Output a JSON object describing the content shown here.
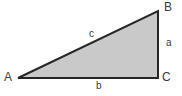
{
  "diagram": {
    "type": "right-triangle-geometry",
    "canvas": {
      "width": 182,
      "height": 96,
      "background": "#ffffff"
    },
    "style": {
      "fill_color": "#c9c9c9",
      "stroke_color": "#262626",
      "stroke_width": 2,
      "label_color": "#3a3a3a"
    },
    "vertices": [
      {
        "name": "A",
        "label": "A",
        "x": 18,
        "y": 78,
        "angle_type": "acute"
      },
      {
        "name": "B",
        "label": "B",
        "x": 158,
        "y": 11,
        "angle_type": "acute"
      },
      {
        "name": "C",
        "label": "C",
        "x": 158,
        "y": 78,
        "angle_type": "right"
      }
    ],
    "sides": [
      {
        "name": "a",
        "label": "a",
        "from": "B",
        "to": "C",
        "role": "opposite-A",
        "orientation": "vertical"
      },
      {
        "name": "b",
        "label": "b",
        "from": "A",
        "to": "C",
        "role": "opposite-B",
        "orientation": "horizontal"
      },
      {
        "name": "c",
        "label": "c",
        "from": "A",
        "to": "B",
        "role": "hypotenuse",
        "orientation": "diagonal"
      }
    ]
  }
}
